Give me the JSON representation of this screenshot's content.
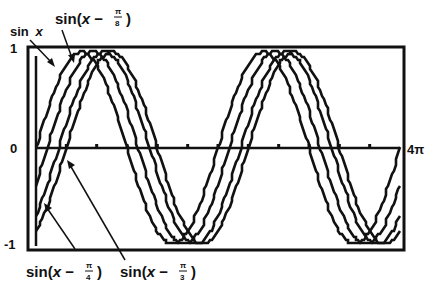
{
  "chart_data": {
    "type": "line",
    "title": "",
    "xlabel": "",
    "ylabel": "",
    "xlim": [
      0,
      12.566
    ],
    "ylim": [
      -1,
      1
    ],
    "grid": false,
    "legend_position": "annotations with arrows",
    "x_tick_labels": [
      "0",
      "4π"
    ],
    "y_tick_labels": [
      "1",
      "0",
      "-1"
    ],
    "x_tick_interval": "π/3",
    "series": [
      {
        "name": "sin x",
        "phase_shift": 0
      },
      {
        "name": "sin(x − π/8)",
        "phase_shift": 0.3927
      },
      {
        "name": "sin(x − π/4)",
        "phase_shift": 0.7854
      },
      {
        "name": "sin(x − π/3)",
        "phase_shift": 1.0472
      }
    ],
    "annotations": [
      {
        "text": "sin x",
        "target_series": 0,
        "position": "top-left"
      },
      {
        "text": "sin(x − π/8)",
        "target_series": 1,
        "position": "top"
      },
      {
        "text": "sin(x − π/4)",
        "target_series": 2,
        "position": "bottom-left"
      },
      {
        "text": "sin(x − π/3)",
        "target_series": 3,
        "position": "bottom"
      }
    ]
  },
  "labels": {
    "y_top": "1",
    "y_zero": "0",
    "y_bottom": "-1",
    "x_end": "4π",
    "sinx_text": "sin",
    "sinx_var": "x",
    "s1_prefix": "sin(",
    "s1_var": "x",
    "s1_minus": " − ",
    "s1_num": "π",
    "s1_den": "8",
    "s1_close": ")",
    "s2_prefix": "sin(",
    "s2_var": "x",
    "s2_minus": " − ",
    "s2_num": "π",
    "s2_den": "4",
    "s2_close": ")",
    "s3_prefix": "sin(",
    "s3_var": "x",
    "s3_minus": " − ",
    "s3_num": "π",
    "s3_den": "3",
    "s3_close": ")"
  },
  "colors": {
    "line": "#111111",
    "background": "#ffffff"
  }
}
